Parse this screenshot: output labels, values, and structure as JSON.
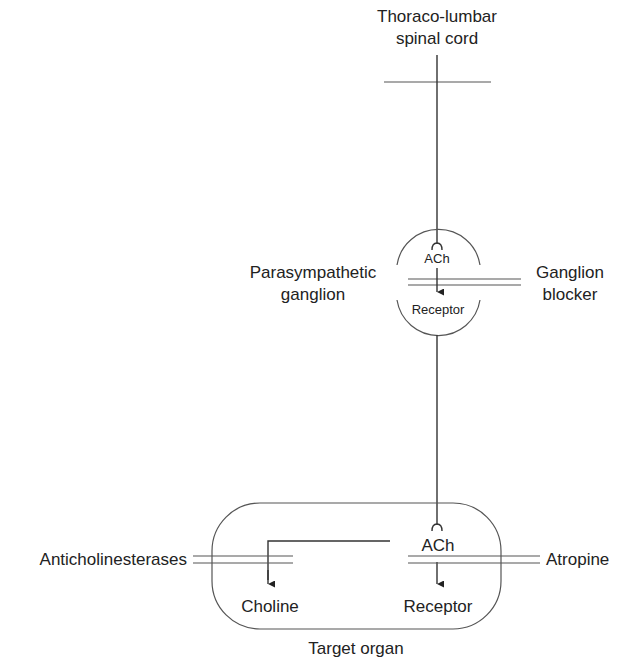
{
  "diagram": {
    "source": {
      "line1": "Thoraco-lumbar",
      "line2": "spinal cord"
    },
    "ganglion": {
      "label_line1": "Parasympathetic",
      "label_line2": "ganglion",
      "transmitter": "ACh",
      "receptor": "Receptor"
    },
    "ganglion_blocker": {
      "line1": "Ganglion",
      "line2": "blocker"
    },
    "target": {
      "label": "Target organ",
      "transmitter": "ACh",
      "breakdown_product": "Choline",
      "receptor": "Receptor"
    },
    "anticholinesterases": "Anticholinesterases",
    "atropine": "Atropine"
  }
}
